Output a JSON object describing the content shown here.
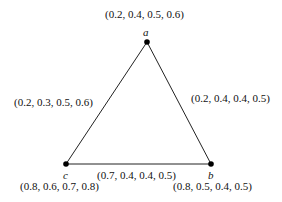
{
  "diagram": {
    "type": "triangle-graph",
    "vertices": [
      {
        "id": "a",
        "label": "a",
        "value": "(0.2, 0.4, 0.5, 0.6)"
      },
      {
        "id": "b",
        "label": "b",
        "value": "(0.8, 0.5, 0.4, 0.5)"
      },
      {
        "id": "c",
        "label": "c",
        "value": "(0.8, 0.6, 0.7, 0.8)"
      }
    ],
    "edges": [
      {
        "from": "a",
        "to": "c",
        "value": "(0.2, 0.3, 0.5, 0.6)"
      },
      {
        "from": "a",
        "to": "b",
        "value": "(0.2, 0.4, 0.4, 0.5)"
      },
      {
        "from": "c",
        "to": "b",
        "value": "(0.7, 0.4, 0.4, 0.5)"
      }
    ]
  }
}
